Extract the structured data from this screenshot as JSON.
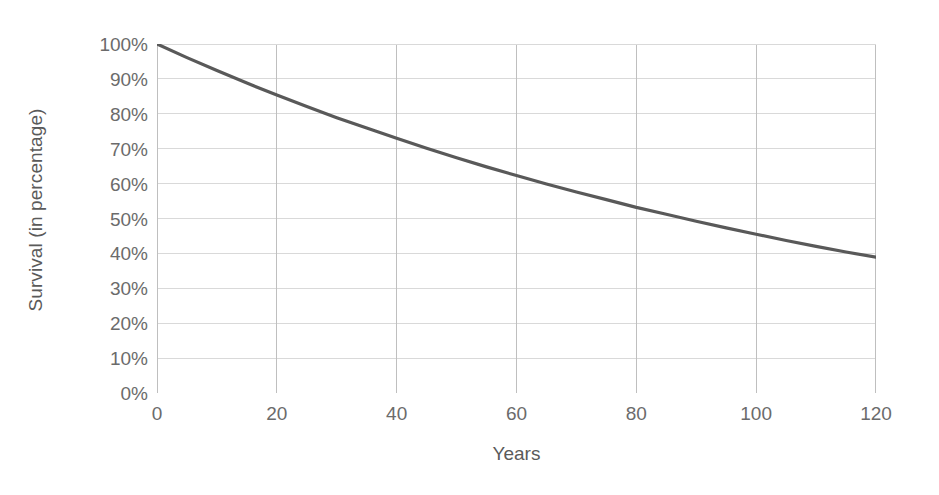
{
  "chart_data": {
    "type": "line",
    "title": "",
    "xlabel": "Years",
    "ylabel": "Survival (in percentage)",
    "xlim": [
      0,
      120
    ],
    "ylim": [
      0,
      100
    ],
    "grid": true,
    "legend": false,
    "line_color": "#595959",
    "grid_color": "#d9d9d9",
    "axis_color": "#bfbfbf",
    "tick_label_color": "#6b6b6b",
    "axis_title_color": "#5a5a5a",
    "x_ticks": [
      "0",
      "20",
      "40",
      "60",
      "80",
      "100",
      "120"
    ],
    "x_tick_values": [
      0,
      20,
      40,
      60,
      80,
      100,
      120
    ],
    "y_ticks": [
      "0%",
      "10%",
      "20%",
      "30%",
      "40%",
      "50%",
      "60%",
      "70%",
      "80%",
      "90%",
      "100%"
    ],
    "y_tick_values": [
      0,
      10,
      20,
      30,
      40,
      50,
      60,
      70,
      80,
      90,
      100
    ],
    "series": [
      {
        "name": "Survival",
        "x": [
          0,
          5,
          10,
          15,
          20,
          25,
          30,
          35,
          40,
          45,
          50,
          55,
          60,
          65,
          70,
          75,
          80,
          85,
          90,
          95,
          100,
          105,
          110,
          115,
          120
        ],
        "values": [
          100.0,
          96.1,
          92.4,
          88.8,
          85.4,
          82.1,
          78.9,
          75.9,
          73.0,
          70.1,
          67.4,
          64.8,
          62.3,
          59.9,
          57.6,
          55.4,
          53.2,
          51.2,
          49.2,
          47.3,
          45.5,
          43.7,
          42.0,
          40.4,
          38.9
        ]
      }
    ]
  }
}
